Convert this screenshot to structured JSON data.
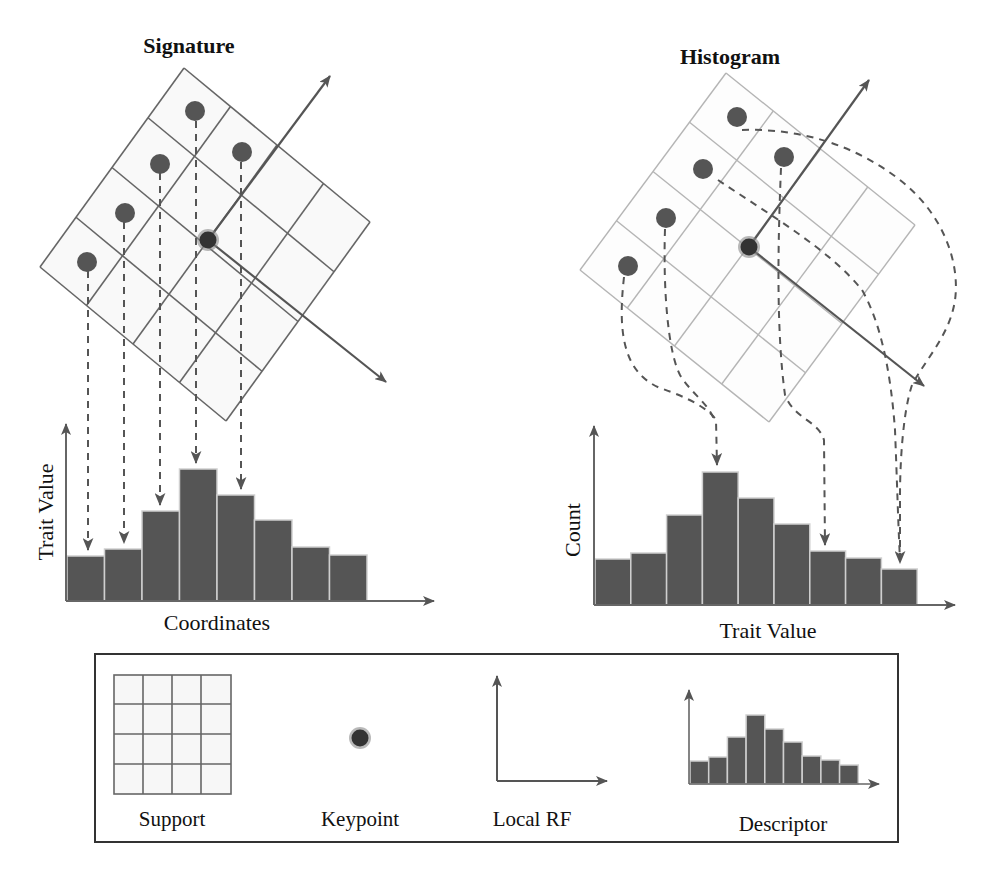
{
  "panels": {
    "signature": {
      "title": "Signature",
      "x_label": "Coordinates",
      "y_label": "Trait Value"
    },
    "histogram": {
      "title": "Histogram",
      "x_label": "Trait Value",
      "y_label": "Count"
    }
  },
  "legend": {
    "items": [
      {
        "label": "Support",
        "icon": "support-grid-icon"
      },
      {
        "label": "Keypoint",
        "icon": "keypoint-icon"
      },
      {
        "label": "Local RF",
        "icon": "local-rf-axes-icon"
      },
      {
        "label": "Descriptor",
        "icon": "descriptor-histogram-icon"
      }
    ]
  },
  "colors": {
    "bar": "#555555",
    "dot": "#555555",
    "keypoint": "#333333",
    "grid_dark": "#666666",
    "grid_light": "#b5b5b5",
    "axis": "#666666"
  },
  "chart_data": [
    {
      "type": "bar",
      "title": "Signature",
      "xlabel": "Coordinates",
      "ylabel": "Trait Value",
      "categories": [
        "1",
        "2",
        "3",
        "4",
        "5",
        "6",
        "7",
        "8"
      ],
      "values": [
        45,
        52,
        90,
        132,
        106,
        81,
        54,
        46
      ],
      "notes": "Relative bar heights in pixels above baseline; 5 dashed arrows map support points straight down onto bars 1-5"
    },
    {
      "type": "bar",
      "title": "Histogram",
      "xlabel": "Trait Value",
      "ylabel": "Count",
      "categories": [
        "1",
        "2",
        "3",
        "4",
        "5",
        "6",
        "7",
        "8",
        "9"
      ],
      "values": [
        46,
        52,
        90,
        133,
        107,
        81,
        54,
        47,
        36
      ],
      "notes": "Relative bar heights in pixels above baseline; curved dashed arrows map support points onto bars 4, 7 and 9"
    },
    {
      "type": "bar",
      "title": "Descriptor (legend)",
      "categories": [
        "1",
        "2",
        "3",
        "4",
        "5",
        "6",
        "7",
        "8",
        "9"
      ],
      "values": [
        23,
        27,
        47,
        69,
        55,
        42,
        28,
        24,
        19
      ]
    }
  ]
}
